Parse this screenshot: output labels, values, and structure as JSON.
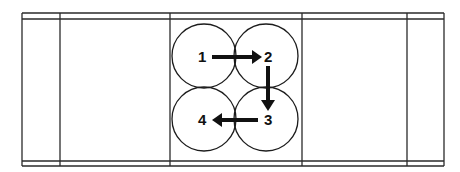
{
  "diagram": {
    "title": "",
    "colors": {
      "line": "#2a2a2a",
      "ink": "#111111",
      "background": "#ffffff"
    },
    "table": {
      "columns": 5,
      "header_band": true,
      "footer_band": true
    },
    "steps": [
      {
        "id": "1",
        "label": "1",
        "position": "top-left"
      },
      {
        "id": "2",
        "label": "2",
        "position": "top-right"
      },
      {
        "id": "3",
        "label": "3",
        "position": "bottom-right"
      },
      {
        "id": "4",
        "label": "4",
        "position": "bottom-left"
      }
    ],
    "sequence": [
      {
        "from": "1",
        "to": "2",
        "direction": "right"
      },
      {
        "from": "2",
        "to": "3",
        "direction": "down"
      },
      {
        "from": "3",
        "to": "4",
        "direction": "left"
      }
    ]
  }
}
